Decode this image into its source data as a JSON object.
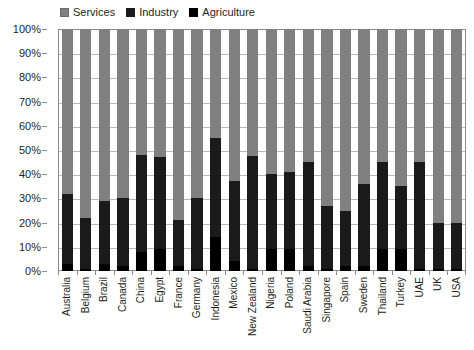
{
  "legend": {
    "position": "top",
    "entries": [
      {
        "label": "Services",
        "color": "#808080",
        "icon": "legend-swatch-icon"
      },
      {
        "label": "Industry",
        "color": "#1a1a1a",
        "icon": "legend-swatch-icon"
      },
      {
        "label": "Agriculture",
        "color": "#000000",
        "icon": "legend-swatch-icon"
      }
    ]
  },
  "axes": {
    "y_ticks": [
      "100%",
      "90%",
      "80%",
      "70%",
      "60%",
      "50%",
      "40%",
      "30%",
      "20%",
      "10%",
      "0%"
    ]
  },
  "chart_data": {
    "type": "bar",
    "stacked": true,
    "stack_total": 100,
    "title": "",
    "subtitle": "",
    "xlabel": "",
    "ylabel": "",
    "ylim": [
      0,
      100
    ],
    "ytick_step": 10,
    "grid": true,
    "legend_position": "top",
    "units": "percent",
    "categories": [
      "Australia",
      "Belgium",
      "Brazil",
      "Canada",
      "China",
      "Egypt",
      "France",
      "Germany",
      "Indonesia",
      "Mexico",
      "New Zealand",
      "Nigeria",
      "Poland",
      "Saudi Arabia",
      "Singapore",
      "Spain",
      "Sweden",
      "Thailand",
      "Turkey",
      "UAE",
      "UK",
      "USA"
    ],
    "series": [
      {
        "name": "Services",
        "color": "#808080",
        "values": [
          68,
          78,
          71,
          70,
          52,
          53,
          79,
          70,
          45,
          63,
          69,
          60,
          59,
          55,
          73,
          75,
          64,
          55,
          65,
          55,
          80,
          80
        ]
      },
      {
        "name": "Industry",
        "color": "#1a1a1a",
        "values": [
          29,
          21,
          26,
          28,
          40,
          38,
          19,
          29,
          41,
          33,
          62,
          31,
          32,
          43,
          26,
          23,
          34,
          36,
          26,
          44,
          19,
          19
        ]
      },
      {
        "name": "Agriculture",
        "color": "#000000",
        "values": [
          3,
          1,
          3,
          2,
          8,
          9,
          2,
          1,
          14,
          4,
          1,
          9,
          9,
          2,
          1,
          2,
          2,
          9,
          9,
          1,
          1,
          1
        ]
      }
    ]
  }
}
